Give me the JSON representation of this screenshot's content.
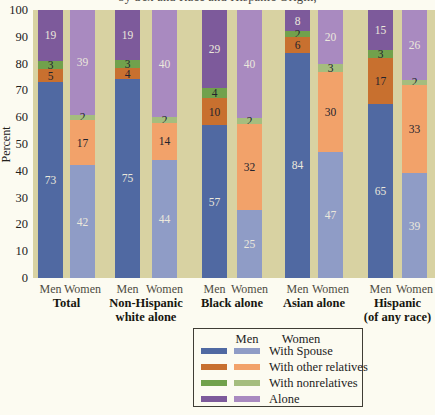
{
  "page": {
    "title_partial": "by Sex and Race and Hispanic Origin,"
  },
  "chart_data": {
    "type": "stacked-bar",
    "title_partial": "by Sex and Race and Hispanic Origin,",
    "ylabel": "Percent",
    "ylim": [
      0,
      100
    ],
    "yticks": [
      0,
      10,
      20,
      30,
      40,
      50,
      60,
      70,
      80,
      90,
      100
    ],
    "unit": "percent",
    "grid": false,
    "sex_labels": [
      "Men",
      "Women"
    ],
    "segments_order": [
      "with_spouse",
      "with_other_relatives",
      "with_nonrelatives",
      "alone"
    ],
    "segment_labels": {
      "with_spouse": "With Spouse",
      "with_other_relatives": "With other relatives",
      "with_nonrelatives": "With nonrelatives",
      "alone": "Alone"
    },
    "groups": [
      {
        "label_lines": [
          "Total"
        ],
        "men": {
          "with_spouse": 73,
          "with_other_relatives": 5,
          "with_nonrelatives": 3,
          "alone": 19
        },
        "women": {
          "with_spouse": 42,
          "with_other_relatives": 17,
          "with_nonrelatives": 2,
          "alone": 39
        }
      },
      {
        "label_lines": [
          "Non-Hispanic",
          "white alone"
        ],
        "men": {
          "with_spouse": 75,
          "with_other_relatives": 4,
          "with_nonrelatives": 3,
          "alone": 19
        },
        "women": {
          "with_spouse": 44,
          "with_other_relatives": 14,
          "with_nonrelatives": 2,
          "alone": 40
        }
      },
      {
        "label_lines": [
          "Black alone"
        ],
        "men": {
          "with_spouse": 57,
          "with_other_relatives": 10,
          "with_nonrelatives": 4,
          "alone": 29
        },
        "women": {
          "with_spouse": 25,
          "with_other_relatives": 32,
          "with_nonrelatives": 2,
          "alone": 40
        }
      },
      {
        "label_lines": [
          "Asian alone"
        ],
        "men": {
          "with_spouse": 84,
          "with_other_relatives": 6,
          "with_nonrelatives": 2,
          "alone": 8
        },
        "women": {
          "with_spouse": 47,
          "with_other_relatives": 30,
          "with_nonrelatives": 3,
          "alone": 20
        }
      },
      {
        "label_lines": [
          "Hispanic",
          "(of any race)"
        ],
        "men": {
          "with_spouse": 65,
          "with_other_relatives": 17,
          "with_nonrelatives": 3,
          "alone": 15
        },
        "women": {
          "with_spouse": 39,
          "with_other_relatives": 33,
          "with_nonrelatives": 2,
          "alone": 26
        }
      }
    ],
    "legend": {
      "header": [
        "Men",
        "Women"
      ],
      "entries": [
        {
          "key": "with_spouse",
          "label": "With Spouse"
        },
        {
          "key": "with_other_relatives",
          "label": "With other relatives"
        },
        {
          "key": "with_nonrelatives",
          "label": "With nonrelatives"
        },
        {
          "key": "alone",
          "label": "Alone"
        }
      ],
      "position": "bottom"
    }
  },
  "colors": {
    "page_bg": "#fcfbf1",
    "plot_bg": "#d8d2a2",
    "legend_bg": "#fcfbf1",
    "legend_border": "#3f3d35",
    "label_light": "#ebe8dc",
    "label_dark": "#23232d",
    "men": {
      "with_spouse": "#5069a2",
      "with_other_relatives": "#c8702f",
      "with_nonrelatives": "#71a14c",
      "alone": "#7d5a9b"
    },
    "women": {
      "with_spouse": "#8f9cc6",
      "with_other_relatives": "#f2a26a",
      "with_nonrelatives": "#a5bd7e",
      "alone": "#a98ac0"
    }
  }
}
